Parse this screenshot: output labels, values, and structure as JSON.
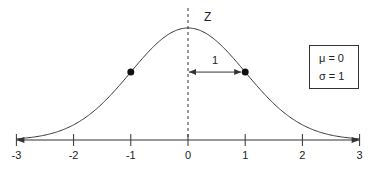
{
  "chart_data": {
    "type": "line",
    "xlabel": "",
    "ylabel": "",
    "variable_label": "Z",
    "x_ticks": [
      -3,
      -2,
      -1,
      0,
      1,
      2,
      3
    ],
    "x_tick_labels": [
      "-3",
      "-2",
      "-1",
      "0",
      "1",
      "2",
      "3"
    ],
    "xlim": [
      -3,
      3
    ],
    "grid": false,
    "series": [
      {
        "name": "standard normal pdf",
        "function": "exp(-x^2/2)/sqrt(2*pi)",
        "mean": 0,
        "sd": 1
      }
    ],
    "marked_points": [
      {
        "x": -1,
        "label": "inflection point"
      },
      {
        "x": 1,
        "label": "inflection point"
      }
    ],
    "annotations": [
      {
        "type": "dashed_vertical_line",
        "x": 0,
        "label": "Z"
      },
      {
        "type": "double_arrow",
        "from": 0,
        "to": 1,
        "label": "1"
      }
    ],
    "legend": {
      "position": "right",
      "entries": [
        "μ = 0",
        "σ = 1"
      ]
    }
  },
  "labels": {
    "z": "Z",
    "distance": "1",
    "mu": "μ = 0",
    "sigma": "σ = 1"
  }
}
